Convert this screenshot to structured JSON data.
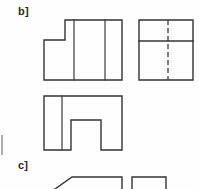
{
  "page": {
    "width": 199,
    "height": 189,
    "background_color": "#fefefe",
    "ink_color": "#333333",
    "hidden_line_color": "#3a3a3a",
    "margin_mark_color": "#9a9a9a"
  },
  "labels": {
    "problem_b": "b]",
    "problem_c": "c]"
  },
  "drawing_data": {
    "type": "orthographic-projection-exercise",
    "description": "Multiview engineering drawing sheet showing three orthographic views of a stepped block for problem b], plus the top edge of the next problem c].",
    "views": [
      {
        "name": "front-view",
        "position": "upper-left",
        "outline_label": "stepped rectangular profile with notch cut from upper-left corner",
        "bounds": {
          "x": 44,
          "y": 20,
          "width": 78,
          "height": 60
        },
        "outline_points": "44,40 44,80 122,80 122,20 65,20 65,40",
        "internal_lines": [
          {
            "name": "vertical-division-left",
            "x1": 74,
            "y1": 20,
            "x2": 74,
            "y2": 80
          },
          {
            "name": "vertical-division-right",
            "x1": 105,
            "y1": 20,
            "x2": 105,
            "y2": 80
          }
        ],
        "hidden_lines": []
      },
      {
        "name": "side-view",
        "position": "upper-right",
        "outline_label": "plain rectangle with horizontal division and hidden vertical line",
        "bounds": {
          "x": 139,
          "y": 20,
          "width": 54,
          "height": 60
        },
        "outline_points": "139,20 193,20 193,80 139,80",
        "internal_lines": [
          {
            "name": "horizontal-division",
            "x1": 139,
            "y1": 41,
            "x2": 193,
            "y2": 41
          }
        ],
        "hidden_lines": [
          {
            "name": "hidden-vertical-centerline",
            "x1": 168,
            "y1": 20,
            "x2": 168,
            "y2": 80
          }
        ]
      },
      {
        "name": "top-view",
        "position": "lower-left",
        "outline_label": "rectangle with U-shaped notch removed from bottom edge",
        "bounds": {
          "x": 44,
          "y": 96,
          "width": 78,
          "height": 54
        },
        "outline_points": "44,96 122,96 122,150 101,150 101,120 71,120 71,150 44,150",
        "internal_lines": [
          {
            "name": "vertical-division-left",
            "x1": 62,
            "y1": 96,
            "x2": 62,
            "y2": 150
          }
        ],
        "hidden_lines": []
      },
      {
        "name": "problem-c-partial-left",
        "position": "bottom-left-cropped",
        "outline_label": "chamfered shape, cropped by page edge",
        "bounds": {
          "x": 55,
          "y": 176,
          "width": 68,
          "height": 13
        },
        "outline_points": "55,189 72,177 122,177 122,189",
        "internal_lines": [],
        "hidden_lines": []
      },
      {
        "name": "problem-c-partial-right",
        "position": "bottom-right-cropped",
        "outline_label": "rectangle, cropped by page edge",
        "bounds": {
          "x": 132,
          "y": 176,
          "width": 34,
          "height": 13
        },
        "outline_points": "132,189 132,177 166,177 166,189",
        "internal_lines": [],
        "hidden_lines": []
      }
    ],
    "margin_marks": [
      {
        "name": "left-margin-tick",
        "x1": 2,
        "y1": 135,
        "x2": 2,
        "y2": 155
      }
    ]
  }
}
